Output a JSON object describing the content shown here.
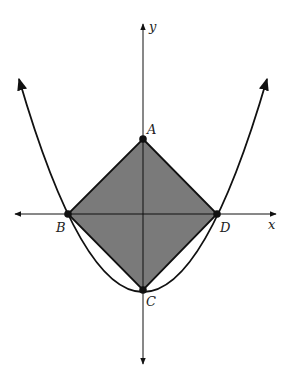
{
  "figure": {
    "type": "coordinate-diagram",
    "axes": {
      "x_label": "x",
      "y_label": "y"
    },
    "points": [
      {
        "name": "A",
        "label": "A"
      },
      {
        "name": "B",
        "label": "B"
      },
      {
        "name": "C",
        "label": "C"
      },
      {
        "name": "D",
        "label": "D"
      }
    ],
    "shape": {
      "name": "square ABCD",
      "vertices": [
        "A",
        "D",
        "C",
        "B"
      ],
      "fill_color": "#7a7a7a"
    },
    "curve": {
      "name": "parabola",
      "vertex": "C",
      "passes_through": [
        "B",
        "D"
      ]
    },
    "colors": {
      "stroke": "#111111",
      "shade": "#7a7a7a",
      "label": "#222222"
    }
  }
}
